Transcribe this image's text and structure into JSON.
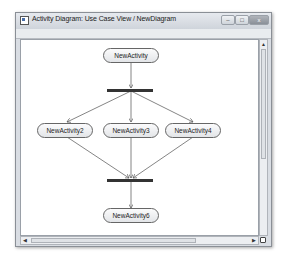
{
  "window": {
    "title": "Activity Diagram: Use Case View / NewDiagram",
    "icon": "diagram-window-icon",
    "controls": {
      "minimize": "–",
      "maximize": "□",
      "close": "x"
    }
  },
  "diagram": {
    "activities": [
      {
        "id": "a1",
        "label": "NewActivity"
      },
      {
        "id": "a2",
        "label": "NewActivity2"
      },
      {
        "id": "a3",
        "label": "NewActivity3"
      },
      {
        "id": "a4",
        "label": "NewActivity4"
      },
      {
        "id": "a6",
        "label": "NewActivity6"
      }
    ],
    "sync_bars": [
      {
        "id": "fork",
        "type": "fork"
      },
      {
        "id": "join",
        "type": "join"
      }
    ],
    "transitions": [
      [
        "NewActivity",
        "fork"
      ],
      [
        "fork",
        "NewActivity2"
      ],
      [
        "fork",
        "NewActivity3"
      ],
      [
        "fork",
        "NewActivity4"
      ],
      [
        "NewActivity2",
        "join"
      ],
      [
        "NewActivity3",
        "join"
      ],
      [
        "NewActivity4",
        "join"
      ],
      [
        "join",
        "NewActivity6"
      ]
    ]
  },
  "scrollbars": {
    "vertical_up": "▲",
    "horizontal_left": "◀",
    "horizontal_right": "▶"
  }
}
